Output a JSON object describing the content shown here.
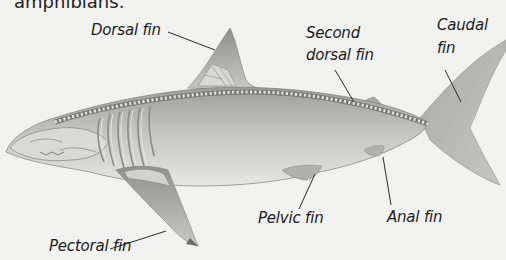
{
  "caption_fragment": "amphibians.",
  "diagram": {
    "labels": {
      "dorsal_fin": "Dorsal fin",
      "second_dorsal_fin_l1": "Second",
      "second_dorsal_fin_l2": "dorsal fin",
      "caudal_fin_l1": "Caudal",
      "caudal_fin_l2": "fin",
      "pectoral_fin": "Pectoral fin",
      "pelvic_fin": "Pelvic fin",
      "anal_fin": "Anal fin"
    },
    "colors": {
      "background": "#f1f1ef",
      "body": "#b9b9b7",
      "belly": "#e2e2e0",
      "skeleton": "#8a8a88",
      "leader_line": "#2a2a2a"
    }
  }
}
